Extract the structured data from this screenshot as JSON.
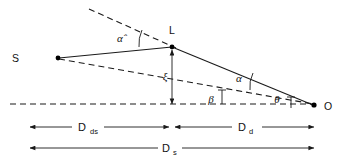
{
  "figure": {
    "type": "line-diagram",
    "width": 339,
    "height": 161,
    "background_color": "#ffffff",
    "line_color": "#1a1a1a"
  },
  "points": [
    {
      "id": "source",
      "label": "S",
      "x": 57,
      "y": 58,
      "label_x": 12,
      "label_y": 62
    },
    {
      "id": "lens",
      "label": "L",
      "x": 172,
      "y": 47,
      "label_x": 169,
      "label_y": 34
    },
    {
      "id": "observer",
      "label": "O",
      "x": 315,
      "y": 105,
      "label_x": 325,
      "label_y": 110
    }
  ],
  "angles": [
    {
      "id": "alpha-hat",
      "label": "α̂",
      "x": 124,
      "y": 39,
      "note": "deflection angle at lens"
    },
    {
      "id": "alpha",
      "label": "α",
      "x": 240,
      "y": 80,
      "note": "angle at observer between image and source"
    },
    {
      "id": "beta",
      "label": "β",
      "x": 211,
      "y": 100,
      "note": "unlensed source angular position"
    },
    {
      "id": "theta",
      "label": "θ",
      "x": 277,
      "y": 100,
      "note": "observed image angular position"
    }
  ],
  "distances": [
    {
      "id": "xi",
      "label": "ξ",
      "x": 166,
      "y": 78,
      "note": "impact parameter, vertical offset at lens plane"
    },
    {
      "id": "d-ds",
      "label": "D",
      "sub": "ds",
      "label_x": 79,
      "label_y": 134,
      "note": "lens-to-source distance"
    },
    {
      "id": "d-d",
      "label": "D",
      "sub": "d",
      "label_x": 241,
      "label_y": 134,
      "note": "observer-to-lens distance"
    },
    {
      "id": "d-s",
      "label": "D",
      "sub": "s",
      "label_x": 167,
      "label_y": 155,
      "note": "observer-to-source distance"
    }
  ],
  "axis": {
    "optical_axis_y": 104,
    "optical_axis_x_start": 10,
    "optical_axis_x_end": 318
  },
  "dimension_lines": {
    "upper_left_start": 28,
    "upper_left_end": 170,
    "upper_right_start": 174,
    "upper_right_end": 315,
    "upper_y": 127,
    "lower_start": 28,
    "lower_end": 315,
    "lower_y": 148
  }
}
